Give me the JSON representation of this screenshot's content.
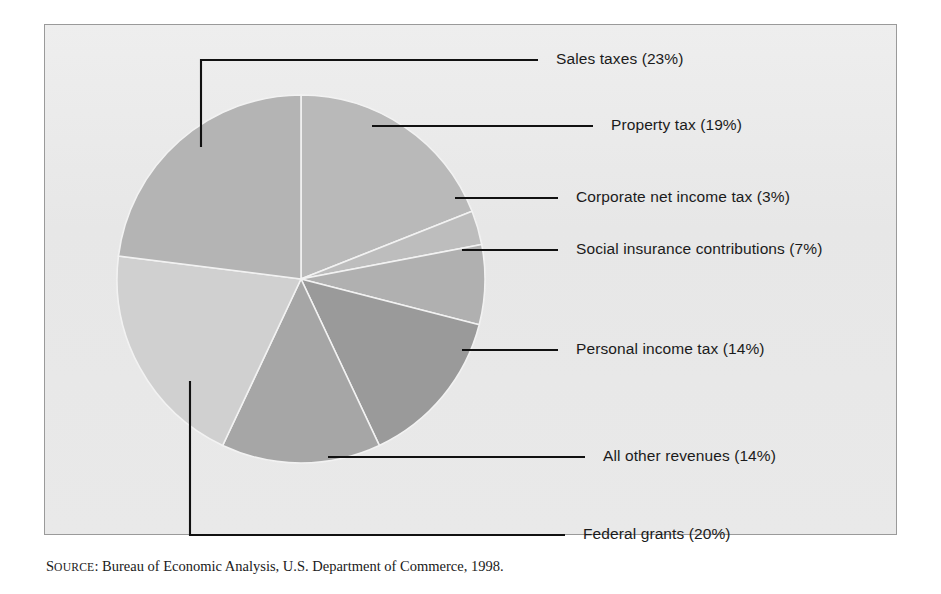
{
  "figure": {
    "background_color": "#ffffff",
    "panel_color": "#e9e9e9",
    "panel_border_color": "#9a9a9a"
  },
  "source_note": {
    "prefix_caps": "S",
    "prefix_rest": "OURCE",
    "separator": ": ",
    "text": "Bureau of Economic Analysis, U.S. Department of Commerce, 1998."
  },
  "labels": {
    "sales_taxes": "Sales taxes (23%)",
    "property_tax": "Property tax (19%)",
    "corporate_net_income_tax": "Corporate net income tax (3%)",
    "social_insurance_contributions": "Social insurance contributions (7%)",
    "personal_income_tax": "Personal income tax (14%)",
    "all_other_revenues": "All other revenues (14%)",
    "federal_grants": "Federal grants (20%)"
  },
  "chart_data": {
    "type": "pie",
    "title": "",
    "subtitle": "",
    "xlabel": "",
    "ylabel": "",
    "grid": false,
    "legend_position": "callout-labels-right",
    "total_percent": 100,
    "start_angle_deg": 0,
    "direction": "clockwise",
    "center": {
      "x": 301,
      "y": 279
    },
    "radius": 184,
    "categories": [
      "Property tax",
      "Corporate net income tax",
      "Social insurance contributions",
      "Personal income tax",
      "All other revenues",
      "Federal grants",
      "Sales taxes"
    ],
    "values": [
      19,
      3,
      7,
      14,
      14,
      20,
      23
    ],
    "labels": [
      "Property tax (19%)",
      "Corporate net income tax (3%)",
      "Social insurance contributions (7%)",
      "Personal income tax (14%)",
      "All other revenues (14%)",
      "Federal grants (20%)",
      "Sales taxes (23%)"
    ],
    "slice_colors": [
      "#b9b9b9",
      "#bdbdbd",
      "#b0b0b0",
      "#9a9a9a",
      "#a6a6a6",
      "#d0d0d0",
      "#b4b4b4"
    ],
    "slice_edge_color": "#f2f2f2",
    "annotations": [
      "Sales taxes (23%)",
      "Property tax (19%)",
      "Corporate net income tax (3%)",
      "Social insurance contributions (7%)",
      "Personal income tax (14%)",
      "All other revenues (14%)",
      "Federal grants (20%)"
    ]
  }
}
